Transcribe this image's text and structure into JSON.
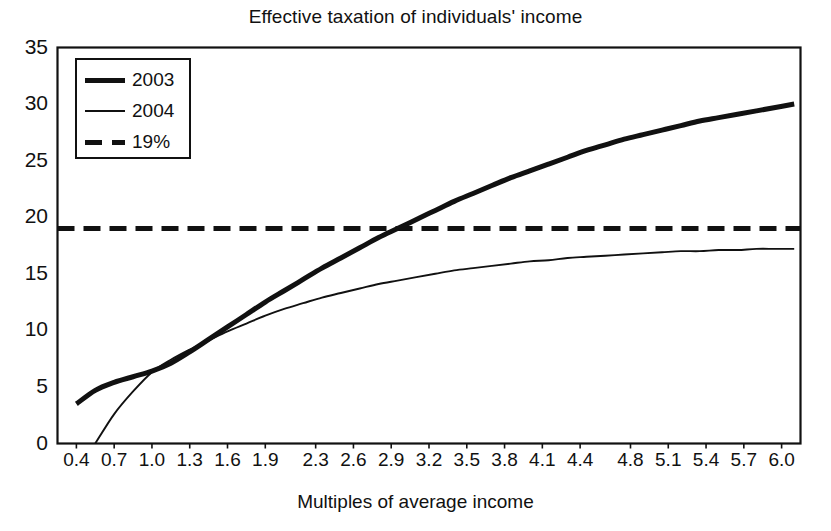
{
  "chart_data": {
    "type": "line",
    "title": "Effective taxation of individuals' income",
    "xlabel": "Multiples of average income",
    "ylabel": "",
    "xlim": [
      0.25,
      6.15
    ],
    "ylim": [
      0,
      35
    ],
    "grid": false,
    "legend_position": "top-left",
    "xtick_labels": [
      "0.4",
      "0.7",
      "1.0",
      "1.3",
      "1.6",
      "1.9",
      "2.3",
      "2.6",
      "2.9",
      "3.2",
      "3.5",
      "3.8",
      "4.1",
      "4.4",
      "4.8",
      "5.1",
      "5.4",
      "5.7",
      "6.0"
    ],
    "ytick_labels": [
      "0",
      "5",
      "10",
      "15",
      "20",
      "25",
      "30",
      "35"
    ],
    "ytick_values": [
      0,
      5,
      10,
      15,
      20,
      25,
      30,
      35
    ],
    "series": [
      {
        "name": "2003",
        "style": "solid-thick",
        "x": [
          0.4,
          0.55,
          0.7,
          0.85,
          1.0,
          1.15,
          1.3,
          1.45,
          1.6,
          1.75,
          1.9,
          2.05,
          2.2,
          2.35,
          2.5,
          2.65,
          2.8,
          2.95,
          3.1,
          3.25,
          3.4,
          3.55,
          3.7,
          3.85,
          4.0,
          4.15,
          4.3,
          4.45,
          4.6,
          4.75,
          4.9,
          5.05,
          5.2,
          5.35,
          5.5,
          5.65,
          5.8,
          5.95,
          6.1
        ],
        "y": [
          3.5,
          4.7,
          5.4,
          5.9,
          6.4,
          7.1,
          8.1,
          9.2,
          10.3,
          11.4,
          12.5,
          13.5,
          14.5,
          15.5,
          16.4,
          17.3,
          18.2,
          19.0,
          19.8,
          20.6,
          21.4,
          22.1,
          22.8,
          23.5,
          24.1,
          24.7,
          25.3,
          25.9,
          26.4,
          26.9,
          27.3,
          27.7,
          28.1,
          28.5,
          28.8,
          29.1,
          29.4,
          29.7,
          30.0
        ]
      },
      {
        "name": "2004",
        "style": "solid-thin",
        "x": [
          0.55,
          0.7,
          0.85,
          1.0,
          1.15,
          1.3,
          1.45,
          1.6,
          1.75,
          1.9,
          2.05,
          2.2,
          2.35,
          2.5,
          2.65,
          2.8,
          2.95,
          3.1,
          3.25,
          3.4,
          3.55,
          3.7,
          3.85,
          4.0,
          4.15,
          4.3,
          4.45,
          4.6,
          4.75,
          4.9,
          5.05,
          5.2,
          5.35,
          5.5,
          5.65,
          5.8,
          5.95,
          6.1
        ],
        "y": [
          0.0,
          2.6,
          4.6,
          6.3,
          7.4,
          8.3,
          9.1,
          9.9,
          10.6,
          11.3,
          11.9,
          12.4,
          12.9,
          13.3,
          13.7,
          14.1,
          14.4,
          14.7,
          15.0,
          15.3,
          15.5,
          15.7,
          15.9,
          16.1,
          16.2,
          16.4,
          16.5,
          16.6,
          16.7,
          16.8,
          16.9,
          17.0,
          17.0,
          17.1,
          17.1,
          17.2,
          17.2,
          17.2
        ]
      },
      {
        "name": "19%",
        "style": "dashed",
        "constant_y": 19,
        "x": [
          0.25,
          6.15
        ],
        "y": [
          19,
          19
        ]
      }
    ]
  },
  "legend": {
    "items": [
      {
        "label": "2003",
        "style": "solid-thick"
      },
      {
        "label": "2004",
        "style": "solid-thin"
      },
      {
        "label": "19%",
        "style": "dashed"
      }
    ]
  },
  "colors": {
    "line": "#111111",
    "background": "#ffffff",
    "axis": "#111111"
  }
}
